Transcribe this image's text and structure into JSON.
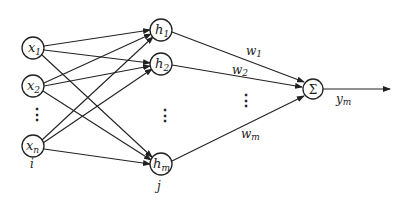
{
  "diagram": {
    "type": "rbf-neural-network",
    "stroke_color": "#222222",
    "background": "#ffffff",
    "input_layer": {
      "index_label": "i",
      "nodes": [
        {
          "label": "x",
          "sub": "1",
          "cx": 33,
          "cy": 48
        },
        {
          "label": "x",
          "sub": "2",
          "cx": 33,
          "cy": 86
        },
        {
          "label": "x",
          "sub": "n",
          "cx": 33,
          "cy": 146
        }
      ],
      "ellipsis": "⋮"
    },
    "hidden_layer": {
      "index_label": "j",
      "nodes": [
        {
          "label": "h",
          "sub": "1",
          "cx": 161,
          "cy": 30
        },
        {
          "label": "h",
          "sub": "2",
          "cx": 161,
          "cy": 64
        },
        {
          "label": "h",
          "sub": "m",
          "cx": 161,
          "cy": 164
        }
      ],
      "ellipsis": "⋮"
    },
    "output_node": {
      "label": "Σ",
      "cx": 313,
      "cy": 89
    },
    "weights": [
      {
        "label": "w",
        "sub": "1"
      },
      {
        "label": "w",
        "sub": "2"
      },
      {
        "label": "w",
        "sub": "m"
      }
    ],
    "weights_ellipsis": "⋮",
    "output": {
      "label": "y",
      "sub": "m"
    }
  }
}
